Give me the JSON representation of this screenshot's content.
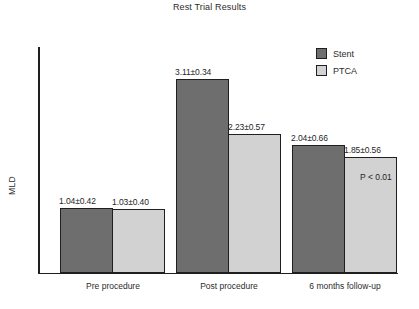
{
  "chart_data": {
    "type": "bar",
    "title": "Rest Trial Results",
    "xlabel": "",
    "ylabel": "MLD",
    "categories": [
      "Pre procedure",
      "Post procedure",
      "6 months follow-up"
    ],
    "ylim": [
      0,
      3.6
    ],
    "grid": false,
    "legend_position": "top-right",
    "series": [
      {
        "name": "Stent",
        "color": "#6e6e6e",
        "values": [
          1.04,
          3.11,
          2.04
        ],
        "errors": [
          0.42,
          0.34,
          0.66
        ],
        "labels": [
          "1.04±0.42",
          "3.11±0.34",
          "2.04±0.66"
        ]
      },
      {
        "name": "PTCA",
        "color": "#d2d2d2",
        "values": [
          1.03,
          2.23,
          1.85
        ],
        "errors": [
          0.4,
          0.57,
          0.56
        ],
        "labels": [
          "1.03±0.40",
          "2.23±0.57",
          "1.85±0.56"
        ]
      }
    ],
    "annotations": [
      {
        "name": "p-value",
        "text": "P < 0.01"
      }
    ]
  },
  "legend": {
    "entries": [
      {
        "label": "Stent",
        "color": "#6e6e6e"
      },
      {
        "label": "PTCA",
        "color": "#d2d2d2"
      }
    ]
  }
}
